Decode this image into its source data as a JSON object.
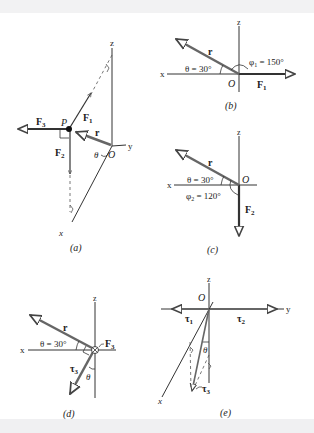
{
  "figure": {
    "panels": [
      {
        "id": "a",
        "caption": "(a)",
        "labels": {
          "z_axis": "z",
          "y_axis": "y",
          "x_axis": "x",
          "point": "P",
          "origin": "O",
          "r": "r",
          "F1": "F",
          "F1_sub": "1",
          "F2": "F",
          "F2_sub": "2",
          "F3": "F",
          "F3_sub": "3",
          "theta": "θ"
        }
      },
      {
        "id": "b",
        "caption": "(b)",
        "labels": {
          "z_axis": "z",
          "x_axis": "x",
          "origin": "O",
          "r": "r",
          "theta_eq": "θ = 30°",
          "phi_eq": "φ",
          "phi_sub": "1",
          "phi_val": " = 150°",
          "F": "F",
          "F_sub": "1"
        }
      },
      {
        "id": "c",
        "caption": "(c)",
        "labels": {
          "z_axis": "z",
          "x_axis": "x",
          "origin": "O",
          "r": "r",
          "theta_eq": "θ = 30°",
          "phi_eq": "φ",
          "phi_sub": "2",
          "phi_val": " = 120°",
          "F": "F",
          "F_sub": "2"
        }
      },
      {
        "id": "d",
        "caption": "(d)",
        "labels": {
          "z_axis": "z",
          "x_axis": "x",
          "r": "r",
          "theta_eq": "θ = 30°",
          "theta": "θ",
          "F": "F",
          "F_sub": "3",
          "tau": "τ",
          "tau_sub": "3"
        }
      },
      {
        "id": "e",
        "caption": "(e)",
        "labels": {
          "z_axis": "z",
          "y_axis": "y",
          "x_axis": "x",
          "origin": "O",
          "tau1": "τ",
          "tau1_sub": "1",
          "tau2": "τ",
          "tau2_sub": "2",
          "tau3": "τ",
          "tau3_sub": "3",
          "theta": "θ"
        }
      }
    ],
    "colors": {
      "axis": "#333333",
      "vector": "#4a4a4a",
      "bold_vector": "#222222",
      "background_band": "#f2f2f3"
    }
  }
}
